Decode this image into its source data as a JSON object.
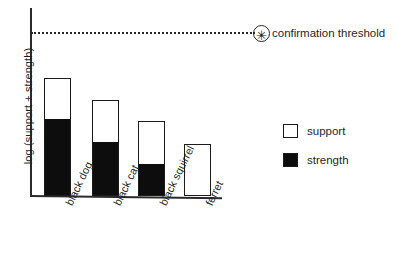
{
  "chart_data": {
    "type": "bar",
    "title": "",
    "subtitle": "",
    "xlabel": "",
    "ylabel": "log (support + strength)",
    "stacked": true,
    "grid": false,
    "legend_position": "right",
    "categories": [
      "black dog",
      "black cat",
      "black squirrel",
      "ferret"
    ],
    "series": [
      {
        "name": "strength",
        "color": "#0d0d0d",
        "values": [
          76,
          53,
          31,
          0
        ]
      },
      {
        "name": "support",
        "color": "#ffffff",
        "values": [
          42,
          43,
          44,
          52
        ]
      }
    ],
    "totals": [
      118,
      96,
      75,
      52
    ],
    "annotations": [
      {
        "name": "confirmation threshold",
        "type": "horizontal-line",
        "value": 163,
        "style": "dotted",
        "marker": "circled-asterisk"
      }
    ],
    "ylim": [
      0,
      188
    ],
    "axis_note": "values are in pixel units above baseline; axis is unlabeled/qualitative"
  },
  "axis": {
    "y_title": "log (support + strength)"
  },
  "threshold": {
    "label": "confirmation threshold",
    "marker_glyph": "✳"
  },
  "legend": {
    "items": [
      {
        "label": "support",
        "swatch": "hollow"
      },
      {
        "label": "strength",
        "swatch": "filled"
      }
    ]
  },
  "bars": [
    {
      "label": "black dog",
      "total_px": 118,
      "strength_px": 76,
      "left_px": 44,
      "width_px": 27
    },
    {
      "label": "black cat",
      "total_px": 96,
      "strength_px": 53,
      "left_px": 92,
      "width_px": 27
    },
    {
      "label": "black squirrel",
      "total_px": 75,
      "strength_px": 31,
      "left_px": 138,
      "width_px": 27
    },
    {
      "label": "ferret",
      "total_px": 52,
      "strength_px": 0,
      "left_px": 184,
      "width_px": 27
    }
  ]
}
